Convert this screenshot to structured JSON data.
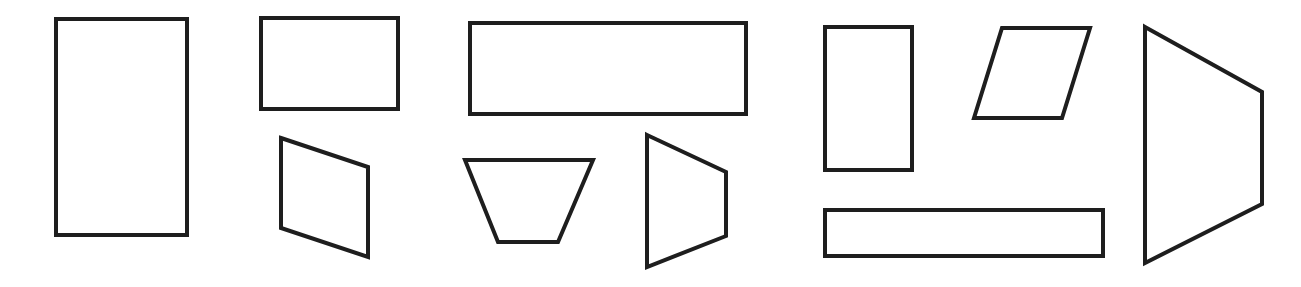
{
  "canvas": {
    "width": 1301,
    "height": 287,
    "background": "#ffffff"
  },
  "style": {
    "stroke_color": "#1e1e1e",
    "fill_color": "#ffffff",
    "stroke_width": 4
  },
  "shapes": [
    {
      "id": "tall-rectangle-left",
      "kind": "rectangle",
      "points": [
        [
          56,
          19
        ],
        [
          187,
          19
        ],
        [
          187,
          235
        ],
        [
          56,
          235
        ]
      ]
    },
    {
      "id": "rectangle-top-middle-left",
      "kind": "rectangle",
      "points": [
        [
          261,
          18
        ],
        [
          398,
          18
        ],
        [
          398,
          109
        ],
        [
          261,
          109
        ]
      ]
    },
    {
      "id": "skewed-quadrilateral",
      "kind": "quadrilateral",
      "points": [
        [
          281,
          138
        ],
        [
          368,
          167
        ],
        [
          368,
          257
        ],
        [
          281,
          228
        ]
      ]
    },
    {
      "id": "wide-rectangle",
      "kind": "rectangle",
      "points": [
        [
          470,
          23
        ],
        [
          746,
          23
        ],
        [
          746,
          114
        ],
        [
          470,
          114
        ]
      ]
    },
    {
      "id": "inverted-trapezoid",
      "kind": "trapezoid",
      "points": [
        [
          465,
          160
        ],
        [
          593,
          160
        ],
        [
          558,
          242
        ],
        [
          498,
          242
        ]
      ]
    },
    {
      "id": "side-trapezoid-small",
      "kind": "trapezoid",
      "points": [
        [
          647,
          135
        ],
        [
          726,
          172
        ],
        [
          726,
          236
        ],
        [
          647,
          267
        ]
      ]
    },
    {
      "id": "tall-rectangle-right",
      "kind": "rectangle",
      "points": [
        [
          825,
          27
        ],
        [
          912,
          27
        ],
        [
          912,
          170
        ],
        [
          825,
          170
        ]
      ]
    },
    {
      "id": "parallelogram",
      "kind": "parallelogram",
      "points": [
        [
          1002,
          28
        ],
        [
          1090,
          28
        ],
        [
          1062,
          118
        ],
        [
          974,
          118
        ]
      ]
    },
    {
      "id": "long-thin-rectangle",
      "kind": "rectangle",
      "points": [
        [
          825,
          210
        ],
        [
          1103,
          210
        ],
        [
          1103,
          256
        ],
        [
          825,
          256
        ]
      ]
    },
    {
      "id": "side-trapezoid-large",
      "kind": "trapezoid",
      "points": [
        [
          1145,
          27
        ],
        [
          1262,
          92
        ],
        [
          1262,
          204
        ],
        [
          1145,
          263
        ]
      ]
    }
  ]
}
